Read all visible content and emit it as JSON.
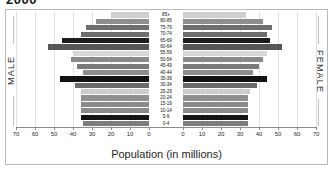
{
  "title": "2000",
  "frame": {
    "male_label": "MALE",
    "female_label": "FEMALE"
  },
  "axis": {
    "title": "Population (in millions)",
    "left_ticks": [
      "70",
      "60",
      "50",
      "40",
      "30",
      "20",
      "10",
      "0"
    ],
    "right_ticks": [
      "0",
      "10",
      "20",
      "30",
      "40",
      "50",
      "60",
      "70"
    ]
  },
  "chart_data": {
    "type": "bar",
    "subtype": "population-pyramid",
    "title": "2000",
    "xlabel": "Population (in millions)",
    "ylabel": "",
    "xlim": [
      0,
      70
    ],
    "grid": true,
    "legend_position": "none",
    "orientation": "horizontal",
    "left_series_name": "MALE",
    "right_series_name": "FEMALE",
    "categories": [
      "85+",
      "80-85",
      "75-79",
      "70-74",
      "65-69",
      "60-64",
      "55-59",
      "50-54",
      "45-49",
      "40-44",
      "35-39",
      "30-34",
      "25-29",
      "20-24",
      "15-19",
      "10-14",
      "5-9",
      "0-4"
    ],
    "series": [
      {
        "name": "MALE",
        "values": [
          20,
          28,
          33,
          36,
          46,
          53,
          40,
          41,
          38,
          35,
          47,
          39,
          36,
          36,
          36,
          36,
          36,
          35
        ]
      },
      {
        "name": "FEMALE",
        "values": [
          33,
          42,
          47,
          44,
          46,
          52,
          44,
          42,
          40,
          37,
          44,
          39,
          35,
          34,
          34,
          34,
          34,
          34
        ]
      }
    ],
    "bar_colors": [
      "#cfcfcf",
      "#8e8e8e",
      "#6e6e6e",
      "#6e6e6e",
      "#1c1c1c",
      "#555555",
      "#d7d7d7",
      "#8a8a8a",
      "#7a7a7a",
      "#8e8e8e",
      "#121212",
      "#6b6b6b",
      "#cccccc",
      "#909090",
      "#8a8a8a",
      "#8a8a8a",
      "#141414",
      "#7e7e7e"
    ]
  }
}
